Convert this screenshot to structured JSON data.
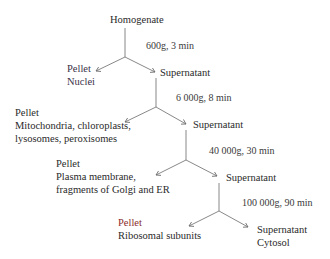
{
  "diagram": {
    "root": "Homogenate",
    "steps": [
      {
        "condition": "600g, 3 min",
        "pellet": {
          "label": "Pellet",
          "contents": [
            "Nuclei"
          ]
        },
        "supernatant": {
          "label": "Supernatant",
          "contents": []
        }
      },
      {
        "condition": "6 000g, 8 min",
        "pellet": {
          "label": "Pellet",
          "contents": [
            "Mitochondria, chloroplasts,",
            "lysosomes, peroxisomes"
          ]
        },
        "supernatant": {
          "label": "Supernatant",
          "contents": []
        }
      },
      {
        "condition": "40 000g, 30 min",
        "pellet": {
          "label": "Pellet",
          "contents": [
            "Plasma membrane,",
            "fragments of Golgi and ER"
          ]
        },
        "supernatant": {
          "label": "Supernatant",
          "contents": []
        }
      },
      {
        "condition": "100 000g, 90 min",
        "pellet": {
          "label": "Pellet",
          "contents": [
            "Ribosomal subunits"
          ]
        },
        "supernatant": {
          "label": "Supernatant",
          "contents": [
            "Cytosol"
          ]
        }
      }
    ],
    "colors": {
      "line": "#7a7a7a",
      "text": "#2a2a2a",
      "accent_red": "#8a2a2a"
    }
  }
}
